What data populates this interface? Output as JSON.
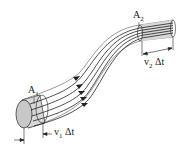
{
  "diagram": {
    "labels": {
      "a1": {
        "main": "A",
        "sub": "1"
      },
      "a2": {
        "main": "A",
        "sub": "2"
      },
      "v1dt": {
        "main": "v",
        "sub": "1",
        "suffix": " Δt"
      },
      "v2dt": {
        "main": "v",
        "sub": "2",
        "suffix": " Δt"
      }
    },
    "colors": {
      "stroke": "#222222",
      "tube_fill": "#e6e6e6",
      "end_face_fill": "#c8c8c8",
      "section_fill": "#d4d4d4"
    },
    "streamline_count": 5
  }
}
